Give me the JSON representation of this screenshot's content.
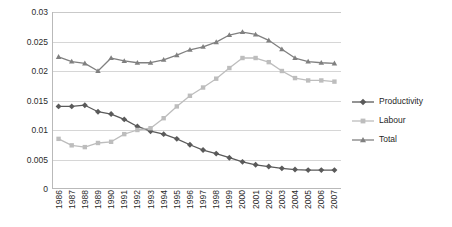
{
  "chart_data": {
    "type": "line",
    "title": "",
    "xlabel": "",
    "ylabel": "",
    "ylim": [
      0,
      0.03
    ],
    "ytick_labels": [
      "0.03",
      "0.025",
      "0.02",
      "0.015",
      "0.01",
      "0.005",
      "0"
    ],
    "ytick_values": [
      0.03,
      0.025,
      0.02,
      0.015,
      0.01,
      0.005,
      0
    ],
    "grid": true,
    "legend_position": "right",
    "categories": [
      "1986",
      "1987",
      "1988",
      "1989",
      "1990",
      "1991",
      "1992",
      "1993",
      "1994",
      "1995",
      "1996",
      "1997",
      "1998",
      "1999",
      "2000",
      "2001",
      "2002",
      "2003",
      "2004",
      "2005",
      "2006",
      "2007"
    ],
    "series": [
      {
        "name": "Productivity",
        "marker": "diamond",
        "color": "#5a5a5a",
        "values": [
          0.014,
          0.014,
          0.0142,
          0.0131,
          0.0127,
          0.0118,
          0.0106,
          0.0098,
          0.0093,
          0.0085,
          0.0075,
          0.0066,
          0.006,
          0.0053,
          0.0046,
          0.0041,
          0.0038,
          0.0035,
          0.0033,
          0.0032,
          0.0032,
          0.0032
        ]
      },
      {
        "name": "Labour",
        "marker": "square",
        "color": "#bdbdbd",
        "values": [
          0.0085,
          0.0074,
          0.0071,
          0.0078,
          0.008,
          0.0093,
          0.01,
          0.0103,
          0.012,
          0.014,
          0.0158,
          0.0172,
          0.0187,
          0.0205,
          0.0222,
          0.0222,
          0.0215,
          0.02,
          0.0188,
          0.0184,
          0.0184,
          0.0182
        ]
      },
      {
        "name": "Total",
        "marker": "triangle",
        "color": "#808080",
        "values": [
          0.0224,
          0.0216,
          0.0213,
          0.02,
          0.0222,
          0.0217,
          0.0214,
          0.0214,
          0.0219,
          0.0227,
          0.0236,
          0.0241,
          0.0249,
          0.0261,
          0.0266,
          0.0262,
          0.0252,
          0.0237,
          0.0222,
          0.0216,
          0.0214,
          0.0213
        ]
      }
    ]
  },
  "legend": {
    "items": [
      {
        "label": "Productivity"
      },
      {
        "label": "Labour"
      },
      {
        "label": "Total"
      }
    ]
  }
}
